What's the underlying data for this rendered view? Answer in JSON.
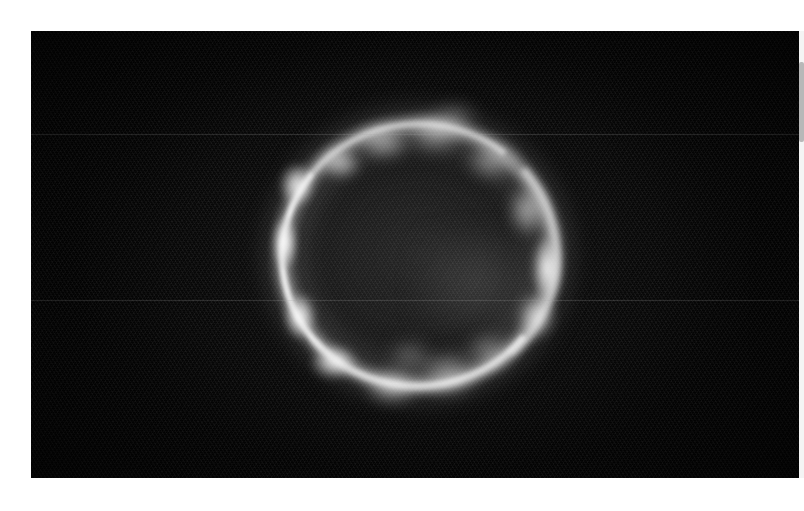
{
  "document": {
    "title": "Astronomical Ring Image",
    "background_color": "#ffffff"
  },
  "image_panel": {
    "name": "astronomical-image",
    "alt_text": "Grayscale astronomical image of a bright clumpy ring-shaped nebular shell on a dark background",
    "frame": {
      "x": 31,
      "y": 31,
      "width": 773,
      "height": 447
    },
    "background_color": "#030303",
    "peak_color": "#ffffff",
    "subject": "ring nebula / supernova remnant shell",
    "colormap": "grayscale"
  },
  "ring": {
    "center_x": 415,
    "center_y": 260,
    "outer_radius_x": 150,
    "outer_radius_y": 145,
    "inner_radius_x": 112,
    "inner_radius_y": 108,
    "brightest_limb": "left",
    "secondary_bright_knot": "right",
    "description": "clumpy limb-brightened annulus"
  },
  "knots": [
    {
      "name": "knot-left-upper",
      "cx": 297,
      "cy": 185,
      "rx": 16,
      "ry": 20,
      "brightness": 0.92,
      "blur": 4
    },
    {
      "name": "knot-left-mid",
      "cx": 285,
      "cy": 243,
      "rx": 12,
      "ry": 26,
      "brightness": 0.96,
      "blur": 3
    },
    {
      "name": "knot-left-lower",
      "cx": 300,
      "cy": 316,
      "rx": 15,
      "ry": 22,
      "brightness": 0.94,
      "blur": 4
    },
    {
      "name": "knot-bottom-left",
      "cx": 334,
      "cy": 362,
      "rx": 22,
      "ry": 16,
      "brightness": 0.9,
      "blur": 5
    },
    {
      "name": "knot-bottom-mid",
      "cx": 392,
      "cy": 386,
      "rx": 26,
      "ry": 17,
      "brightness": 0.62,
      "blur": 7
    },
    {
      "name": "knot-bottom-right",
      "cx": 448,
      "cy": 374,
      "rx": 28,
      "ry": 20,
      "brightness": 0.52,
      "blur": 8
    },
    {
      "name": "knot-bottom-far",
      "cx": 490,
      "cy": 352,
      "rx": 22,
      "ry": 17,
      "brightness": 0.45,
      "blur": 8
    },
    {
      "name": "knot-right-lower",
      "cx": 536,
      "cy": 316,
      "rx": 18,
      "ry": 22,
      "brightness": 0.7,
      "blur": 6
    },
    {
      "name": "knot-right-bright",
      "cx": 547,
      "cy": 268,
      "rx": 14,
      "ry": 32,
      "brightness": 0.98,
      "blur": 4
    },
    {
      "name": "knot-right-upper",
      "cx": 528,
      "cy": 210,
      "rx": 18,
      "ry": 24,
      "brightness": 0.66,
      "blur": 7
    },
    {
      "name": "knot-top-right",
      "cx": 492,
      "cy": 160,
      "rx": 24,
      "ry": 18,
      "brightness": 0.56,
      "blur": 8
    },
    {
      "name": "knot-top-mid",
      "cx": 436,
      "cy": 132,
      "rx": 28,
      "ry": 19,
      "brightness": 0.6,
      "blur": 8
    },
    {
      "name": "knot-top-left",
      "cx": 383,
      "cy": 142,
      "rx": 26,
      "ry": 16,
      "brightness": 0.62,
      "blur": 7
    },
    {
      "name": "knot-top-arc",
      "cx": 340,
      "cy": 163,
      "rx": 20,
      "ry": 15,
      "brightness": 0.74,
      "blur": 6
    },
    {
      "name": "knot-inner-bottom",
      "cx": 410,
      "cy": 356,
      "rx": 20,
      "ry": 14,
      "brightness": 0.4,
      "blur": 9
    },
    {
      "name": "knot-outer-topmid",
      "cx": 455,
      "cy": 118,
      "rx": 20,
      "ry": 13,
      "brightness": 0.42,
      "blur": 9
    }
  ],
  "artifacts": {
    "horizontal_lines_y": [
      134,
      300
    ],
    "scanline_angle_deg": 58,
    "vignette": true
  },
  "scrollbar": {
    "name": "vertical-scrollbar",
    "track_color": "#f4f4f4",
    "thumb_color": "#b8b8b8",
    "thumb_top": 31,
    "thumb_height": 80,
    "orientation": "vertical"
  }
}
